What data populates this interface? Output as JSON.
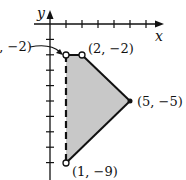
{
  "axes": {
    "x_label": "x",
    "y_label": "y",
    "x_ticks": [
      1,
      2,
      3,
      4,
      5,
      6
    ],
    "y_ticks": [
      -1,
      -2,
      -3,
      -4,
      -5,
      -6,
      -7,
      -8,
      -9
    ]
  },
  "region": {
    "fill": "#c8c8c8",
    "vertices": [
      {
        "x": 1,
        "y": -2,
        "label": "(1, −2)",
        "open": true
      },
      {
        "x": 2,
        "y": -2,
        "label": "(2, −2)",
        "open": true
      },
      {
        "x": 5,
        "y": -5,
        "label": "(5, −5)",
        "open": false
      },
      {
        "x": 1,
        "y": -9,
        "label": "(1, −9)",
        "open": true
      }
    ],
    "dashed_edge": "x = 1 from (1,-2) to (1,-9)"
  },
  "labels": {
    "v1": "(1, −2)",
    "v2": "(2, −2)",
    "v3": "(5, −5)",
    "v4": "(1, −9)",
    "x": "x",
    "y": "y"
  }
}
